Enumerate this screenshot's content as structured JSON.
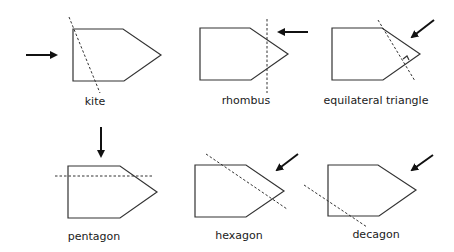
{
  "figure": {
    "colors": {
      "stroke": "#333333",
      "arrow": "#111111",
      "text": "#1a1a1a",
      "background": "#ffffff"
    },
    "panels": [
      {
        "label": "kite",
        "cut": "dashed diagonal through top-left corner",
        "arrow": "from left pointing right"
      },
      {
        "label": "rhombus",
        "cut": "dashed vertical line near tip",
        "arrow": "from right pointing left"
      },
      {
        "label": "equilateral triangle",
        "cut": "dashed line perpendicular to upper-right edge with right-angle marker",
        "arrow": "from upper right pointing down-left"
      },
      {
        "label": "pentagon",
        "cut": "dashed horizontal line near top",
        "arrow": "from above pointing down"
      },
      {
        "label": "hexagon",
        "cut": "dashed diagonal line across upper part",
        "arrow": "from upper right pointing down-left"
      },
      {
        "label": "decagon",
        "cut": "dashed diagonal line across lower-left corner",
        "arrow": "from upper right pointing down-left"
      }
    ]
  }
}
